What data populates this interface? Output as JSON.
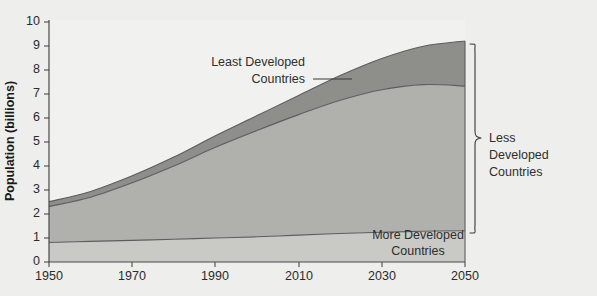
{
  "chart_data": {
    "type": "area",
    "title": "",
    "subtitle": "",
    "xlabel": "",
    "ylabel": "Population (billions)",
    "xlim": [
      1950,
      2050
    ],
    "ylim": [
      0,
      10
    ],
    "grid": false,
    "legend_position": "inline-annotations",
    "stacked": true,
    "x": [
      1950,
      1960,
      1970,
      1980,
      1990,
      2000,
      2010,
      2020,
      2030,
      2040,
      2050
    ],
    "x_tick_labels": [
      "1950",
      "1970",
      "1990",
      "2010",
      "2030",
      "2050"
    ],
    "x_ticks": [
      1950,
      1970,
      1990,
      2010,
      2030,
      2050
    ],
    "y_tick_labels": [
      "0",
      "1",
      "2",
      "3",
      "4",
      "5",
      "6",
      "7",
      "8",
      "9",
      "10"
    ],
    "y_ticks": [
      0,
      1,
      2,
      3,
      4,
      5,
      6,
      7,
      8,
      9,
      10
    ],
    "series": [
      {
        "name": "More Developed Countries",
        "color": "#c9c9c5",
        "values": [
          0.81,
          0.86,
          0.9,
          0.95,
          1.0,
          1.05,
          1.12,
          1.19,
          1.24,
          1.28,
          1.3
        ]
      },
      {
        "name": "Less Developed Countries",
        "color": "#b0b0ad",
        "values": [
          1.5,
          1.84,
          2.4,
          3.05,
          3.78,
          4.43,
          5.02,
          5.55,
          5.94,
          6.11,
          6.03
        ]
      },
      {
        "name": "Least Developed Countries",
        "color": "#8e8e8b",
        "values": [
          0.2,
          0.24,
          0.29,
          0.37,
          0.48,
          0.62,
          0.8,
          1.03,
          1.3,
          1.6,
          1.88
        ]
      }
    ],
    "cumulative_more_developed": [
      0.81,
      0.86,
      0.9,
      0.95,
      1.0,
      1.05,
      1.12,
      1.19,
      1.24,
      1.28,
      1.3
    ],
    "cumulative_less_developed_top": [
      2.31,
      2.7,
      3.3,
      4.0,
      4.78,
      5.48,
      6.14,
      6.74,
      7.18,
      7.39,
      7.33
    ],
    "cumulative_total": [
      2.51,
      2.94,
      3.59,
      4.37,
      5.26,
      6.1,
      6.94,
      7.77,
      8.48,
      8.99,
      9.21
    ],
    "annotations": [
      {
        "name": "least-developed",
        "text_line1": "Least Developed",
        "text_line2": "Countries"
      },
      {
        "name": "more-developed",
        "text_line1": "More Developed",
        "text_line2": "Countries"
      },
      {
        "name": "less-developed-brace",
        "text_line1": "Less",
        "text_line2": "Developed",
        "text_line3": "Countries"
      }
    ]
  },
  "axes": {
    "y_title": "Population (billions)",
    "y_labels": [
      "10",
      "9",
      "8",
      "7",
      "6",
      "5",
      "4",
      "3",
      "2",
      "1",
      "0"
    ],
    "x_labels": [
      "1950",
      "1970",
      "1990",
      "2010",
      "2030",
      "2050"
    ]
  },
  "labels": {
    "least_dev_1": "Least Developed",
    "least_dev_2": "Countries",
    "more_dev_1": "More Developed",
    "more_dev_2": "Countries",
    "less_dev_1": "Less",
    "less_dev_2": "Developed",
    "less_dev_3": "Countries"
  },
  "colors": {
    "background": "#eeeeec",
    "plot_background": "#f1f1ef",
    "band_least_developed": "#8e8e8b",
    "band_less_developed": "#b0b0ad",
    "band_more_developed": "#c9c9c5",
    "axis": "#4a4a4a",
    "text": "#2b2b2b"
  }
}
